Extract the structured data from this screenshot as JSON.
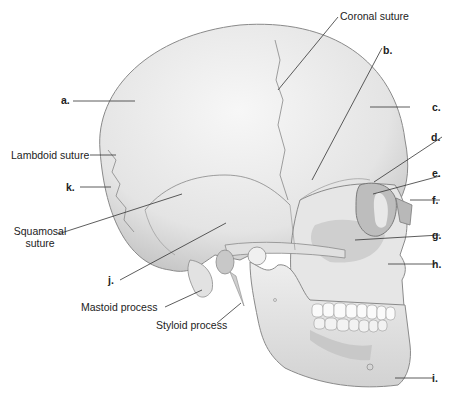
{
  "figure": {
    "colors": {
      "bone_light": "#f2f2f2",
      "bone_mid": "#dcdcdc",
      "bone_shadow": "#b8b8b8",
      "outline": "#8a8a8a",
      "leader_line": "#333333",
      "text": "#222222"
    }
  },
  "labels": {
    "coronal_suture": "Coronal suture",
    "b": "b.",
    "a": "a.",
    "c": "c.",
    "lambdoid_suture": "Lambdoid suture",
    "d": "d.",
    "e": "e.",
    "k": "k.",
    "f": "f.",
    "squamosal_suture_line1": "Squamosal",
    "squamosal_suture_line2": "suture",
    "g": "g.",
    "j": "j.",
    "h": "h.",
    "mastoid_process": "Mastoid process",
    "styloid_process": "Styloid process",
    "i": "i."
  }
}
